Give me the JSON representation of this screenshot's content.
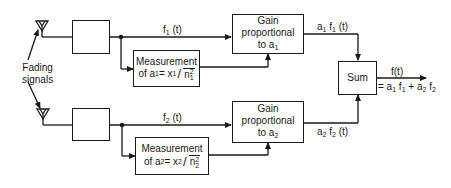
{
  "diagram": {
    "type": "block-diagram",
    "title": "",
    "colors": {
      "line": "#1a1a1a",
      "background": "#ffffff"
    },
    "inputs_label": {
      "line1": "Fading",
      "line2": "signals"
    },
    "branch1": {
      "antenna": "antenna-icon",
      "receiver_box_label": "",
      "signal_label": {
        "base": "f",
        "sub": "1",
        "tail": " (t)"
      },
      "measurement": {
        "line1": "Measurement",
        "prefix": "of a",
        "prefix_sub": "1",
        "eq": " = x",
        "x_sub": "1",
        "denom_base": "n",
        "denom_sup": "2",
        "denom_sub": "1"
      },
      "gain": {
        "line1": "Gain",
        "line2": "proportional",
        "line3": "to a",
        "line3_sub": "1"
      },
      "output_label": {
        "a": "a",
        "a_sub": "1",
        "f": " f",
        "f_sub": "1",
        "tail": " (t)"
      }
    },
    "branch2": {
      "antenna": "antenna-icon",
      "receiver_box_label": "",
      "signal_label": {
        "base": "f",
        "sub": "2",
        "tail": " (t)"
      },
      "measurement": {
        "line1": "Measurement",
        "prefix": "of a",
        "prefix_sub": "2",
        "eq": " = x",
        "x_sub": "2",
        "denom_base": "n",
        "denom_sup": "2",
        "denom_sub": "2"
      },
      "gain": {
        "line1": "Gain",
        "line2": "proportional",
        "line3": "to a",
        "line3_sub": "2"
      },
      "output_label": {
        "a": "a",
        "a_sub": "2",
        "f": " f",
        "f_sub": "2",
        "tail": " (t)"
      }
    },
    "sum": {
      "label": "Sum",
      "output_top": "f(t)",
      "output_bottom": {
        "eq": "= a",
        "a1_sub": "1",
        "f1": " f",
        "f1_sub": "1",
        "plus": " + a",
        "a2_sub": "2",
        "f2": " f",
        "f2_sub": "2"
      }
    }
  }
}
